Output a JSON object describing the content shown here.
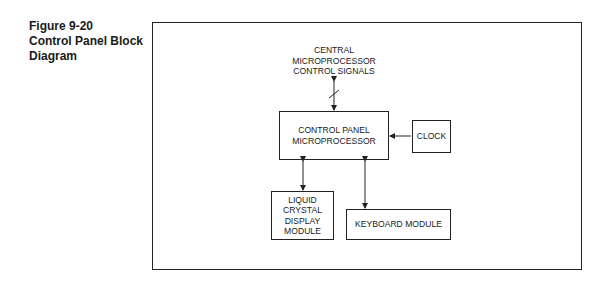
{
  "caption": {
    "line1": "Figure 9-20",
    "line2": "Control Panel Block",
    "line3": "Diagram"
  },
  "diagram": {
    "signals_label": [
      "CENTRAL",
      "MICROPROCESSOR",
      "CONTROL SIGNALS"
    ],
    "control_panel": [
      "CONTROL PANEL",
      "MICROPROCESSOR"
    ],
    "clock": "CLOCK",
    "lcd_module": [
      "LIQUID",
      "CRYSTAL",
      "DISPLAY",
      "MODULE"
    ],
    "keyboard_module": "KEYBOARD MODULE"
  }
}
